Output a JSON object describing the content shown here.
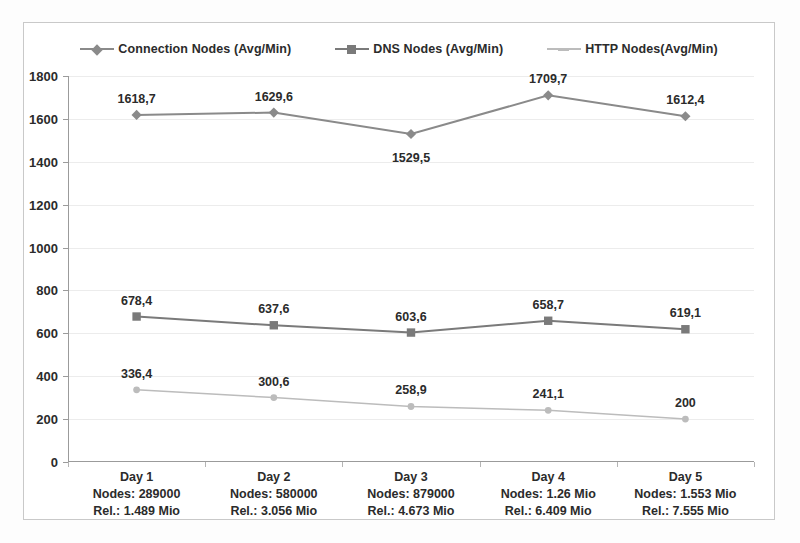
{
  "chart_data": {
    "type": "line",
    "title": "",
    "xlabel": "",
    "ylabel": "",
    "ylim": [
      0,
      1800
    ],
    "yticks": [
      0,
      200,
      400,
      600,
      800,
      1000,
      1200,
      1400,
      1600,
      1800
    ],
    "grid": true,
    "legend_position": "top",
    "categories": [
      "Day 1",
      "Day 2",
      "Day 3",
      "Day 4",
      "Day 5"
    ],
    "category_details": [
      {
        "name": "Day 1",
        "nodes": "Nodes: 289000",
        "rel": "Rel.: 1.489 Mio"
      },
      {
        "name": "Day 2",
        "nodes": "Nodes: 580000",
        "rel": "Rel.: 3.056 Mio"
      },
      {
        "name": "Day 3",
        "nodes": "Nodes: 879000",
        "rel": "Rel.: 4.673 Mio"
      },
      {
        "name": "Day 4",
        "nodes": "Nodes: 1.26 Mio",
        "rel": "Rel.: 6.409 Mio"
      },
      {
        "name": "Day 5",
        "nodes": "Nodes: 1.553 Mio",
        "rel": "Rel.: 7.555 Mio"
      }
    ],
    "series": [
      {
        "name": "Connection Nodes (Avg/Min)",
        "marker": "diamond",
        "color": "#8a8a8a",
        "values": [
          1618.7,
          1629.6,
          1529.5,
          1709.7,
          1612.4
        ],
        "labels": [
          "1618,7",
          "1629,6",
          "1529,5",
          "1709,7",
          "1612,4"
        ],
        "label_positions": [
          "above",
          "above",
          "below",
          "above",
          "above"
        ]
      },
      {
        "name": "DNS Nodes (Avg/Min)",
        "marker": "square",
        "color": "#7a7a7a",
        "values": [
          678.4,
          637.6,
          603.6,
          658.7,
          619.1
        ],
        "labels": [
          "678,4",
          "637,6",
          "603,6",
          "658,7",
          "619,1"
        ],
        "label_positions": [
          "above",
          "above",
          "above",
          "above",
          "above"
        ]
      },
      {
        "name": "HTTP Nodes(Avg/Min)",
        "marker": "dash",
        "color": "#bcbcbc",
        "values": [
          336.4,
          300.6,
          258.9,
          241.1,
          200.0
        ],
        "labels": [
          "336,4",
          "300,6",
          "258,9",
          "241,1",
          "200"
        ],
        "label_positions": [
          "above",
          "above",
          "above",
          "above",
          "above"
        ]
      }
    ]
  },
  "colors": {
    "series_connection": "#8a8a8a",
    "series_dns": "#7a7a7a",
    "series_http": "#bcbcbc",
    "axis": "#9b9b9b",
    "grid": "#ececec",
    "text": "#2b2b2b",
    "frame": "#c9c9c9",
    "background": "#ffffff"
  }
}
